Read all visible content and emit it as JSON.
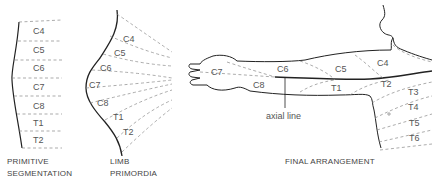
{
  "panels": {
    "primitive": {
      "caption_line1": "PRIMITIVE",
      "caption_line2": "SEGMENTATION",
      "segments": [
        "C4",
        "C5",
        "C6",
        "C7",
        "C8",
        "T1",
        "T2"
      ]
    },
    "limb": {
      "caption_line1": "LIMB",
      "caption_line2": "PRIMORDIA",
      "segments": [
        "C4",
        "C5",
        "C6",
        "C7",
        "C8",
        "T1",
        "T2"
      ]
    },
    "final": {
      "caption": "FINAL ARRANGEMENT",
      "axial_label": "axial line",
      "segments": {
        "c7": "C7",
        "c6": "C6",
        "c5": "C5",
        "c4": "C4",
        "c8": "C8",
        "t1": "T1",
        "t2": "T2",
        "t3": "T3",
        "t4": "T4",
        "t5": "T5",
        "t6": "T6"
      }
    }
  }
}
